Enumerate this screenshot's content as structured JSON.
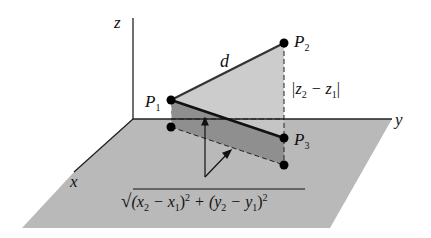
{
  "diagram": {
    "type": "3d-distance-formula",
    "axes": {
      "x": "x",
      "y": "y",
      "z": "z"
    },
    "points": [
      {
        "name": "P",
        "sub": "1",
        "role": "start point"
      },
      {
        "name": "P",
        "sub": "2",
        "role": "end point"
      },
      {
        "name": "P",
        "sub": "3",
        "role": "right-angle vertex"
      }
    ],
    "labels": {
      "distance": "d",
      "vertical_leg": {
        "open": "|z",
        "sub1": "2",
        "mid": " − z",
        "sub2": "1",
        "close": "|"
      },
      "horizontal_leg": {
        "radical": "√",
        "t1": "(x",
        "s1": "2",
        "t2": " − x",
        "s2": "1",
        "t3": ")",
        "e1": "2",
        "t4": " + (y",
        "s3": "2",
        "t5": " − y",
        "s4": "1",
        "t6": ")",
        "e2": "2"
      }
    },
    "colors": {
      "floor": "#b8b8b8",
      "vertical_triangle": "#c4c4c4",
      "floor_projection": "#8e8e8e",
      "lines": "#111111",
      "background": "#ffffff"
    }
  }
}
